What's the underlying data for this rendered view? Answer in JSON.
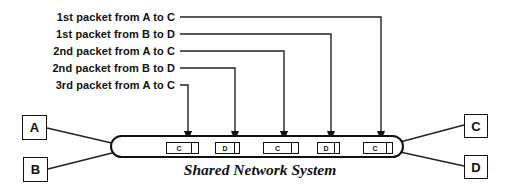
{
  "diagram": {
    "caption": "Shared Network System",
    "packet_labels": [
      {
        "text": "1st packet from A to C"
      },
      {
        "text": "1st packet from B to D"
      },
      {
        "text": "2nd packet from A to C"
      },
      {
        "text": "2nd packet from B to D"
      },
      {
        "text": "3rd packet from A to C"
      }
    ],
    "hosts": {
      "left": [
        {
          "label": "A"
        },
        {
          "label": "B"
        }
      ],
      "right": [
        {
          "label": "C"
        },
        {
          "label": "D"
        }
      ]
    },
    "packets_in_pipe": [
      {
        "label": "C"
      },
      {
        "label": "D"
      },
      {
        "label": "C"
      },
      {
        "label": "D"
      },
      {
        "label": "C"
      }
    ],
    "colors": {
      "line": "#222222",
      "shape_border": "#111111",
      "text": "#111111",
      "background": "#ffffff"
    }
  }
}
